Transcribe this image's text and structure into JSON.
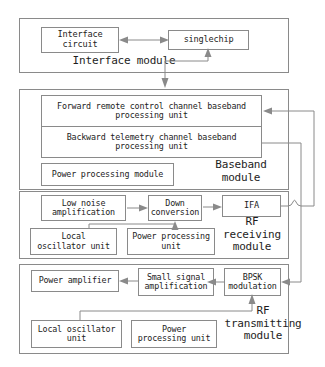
{
  "diagram": {
    "line_color": "#8a8a8a",
    "text_color": "#1d1d1d",
    "background": "#ffffff"
  },
  "modules": [
    {
      "id": "interface",
      "caption": "Interface module",
      "boxes": [
        {
          "id": "interface-circuit",
          "label": "Interface\ncircuit"
        },
        {
          "id": "singlechip",
          "label": "singlechip"
        }
      ]
    },
    {
      "id": "baseband",
      "caption": "Baseband\nmodule",
      "boxes": [
        {
          "id": "forward-unit",
          "label": "Forward remote control channel baseband\nprocessing unit"
        },
        {
          "id": "backward-unit",
          "label": "Backward telemetry channel baseband\nprocessing unit"
        },
        {
          "id": "baseband-power",
          "label": "Power processing module"
        }
      ]
    },
    {
      "id": "rf-receiving",
      "caption": "RF\nreceiving\nmodule",
      "boxes": [
        {
          "id": "low-noise-amplification",
          "label": "Low noise\namplification"
        },
        {
          "id": "down-conversion",
          "label": "Down\nconversion"
        },
        {
          "id": "ifa",
          "label": "IFA"
        },
        {
          "id": "rx-local-oscillator",
          "label": "Local\noscillator unit"
        },
        {
          "id": "rx-power",
          "label": "Power processing\nunit"
        }
      ]
    },
    {
      "id": "rf-transmitting",
      "caption": "RF\ntransmitting\nmodule",
      "boxes": [
        {
          "id": "power-amplifier",
          "label": "Power amplifier"
        },
        {
          "id": "small-signal-amplification",
          "label": "Small signal\namplification"
        },
        {
          "id": "bpsk-modulation",
          "label": "BPSK\nmodulation"
        },
        {
          "id": "tx-local-oscillator",
          "label": "Local oscillator\nunit"
        },
        {
          "id": "tx-power",
          "label": "Power\nprocessing unit"
        }
      ]
    }
  ],
  "connections": [
    {
      "id": "interface-circuit-to-singlechip",
      "type": "bidirectional"
    },
    {
      "id": "singlechip-to-baseband",
      "type": "bidirectional-branch"
    },
    {
      "id": "lna-to-down-conversion",
      "type": "arrow"
    },
    {
      "id": "down-conversion-to-ifa",
      "type": "arrow"
    },
    {
      "id": "rx-oscillator-to-down-conversion",
      "type": "arrow"
    },
    {
      "id": "ifa-to-forward-unit",
      "type": "arrow"
    },
    {
      "id": "backward-unit-to-bpsk",
      "type": "arrow"
    },
    {
      "id": "bpsk-to-small-signal",
      "type": "arrow"
    },
    {
      "id": "small-signal-to-power-amplifier",
      "type": "arrow"
    },
    {
      "id": "tx-oscillator-to-bpsk",
      "type": "arrow"
    }
  ]
}
